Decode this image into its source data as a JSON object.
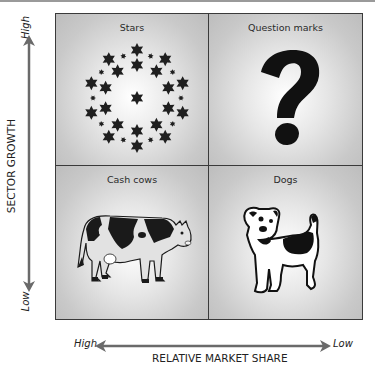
{
  "diagram": {
    "type": "2x2 matrix",
    "quadrants": {
      "top_left": {
        "label": "Stars",
        "icon": "stars-ring-icon"
      },
      "top_right": {
        "label": "Question marks",
        "icon": "question-mark-icon"
      },
      "bottom_left": {
        "label": "Cash cows",
        "icon": "cow-icon"
      },
      "bottom_right": {
        "label": "Dogs",
        "icon": "dog-icon"
      }
    },
    "y_axis": {
      "title": "SECTOR GROWTH",
      "high_label": "High",
      "low_label": "Low",
      "arrow": "double-headed vertical"
    },
    "x_axis": {
      "title": "RELATIVE MARKET SHARE",
      "high_label": "High",
      "low_label": "Low",
      "arrow": "double-headed horizontal"
    },
    "colors": {
      "panel": "#c9c9c9",
      "panel_glow": "#ffffff",
      "border": "#3a3a3a",
      "ink": "#1a1a1a",
      "arrow": "#707070"
    }
  }
}
